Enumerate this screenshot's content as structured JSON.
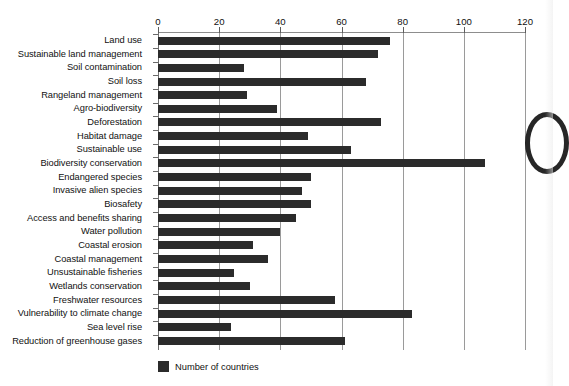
{
  "chart_data": {
    "type": "bar",
    "orientation": "horizontal",
    "title": "",
    "xlabel": "",
    "ylabel": "",
    "xlim": [
      0,
      120
    ],
    "xticks": [
      0,
      20,
      40,
      60,
      80,
      100,
      120
    ],
    "grid": true,
    "legend": {
      "position": "bottom-left",
      "entries": [
        {
          "label": "Number of countries",
          "color": "#2b2b2b"
        }
      ]
    },
    "series": [
      {
        "name": "Number of countries",
        "color": "#2b2b2b",
        "values": [
          76,
          72,
          28,
          68,
          29,
          39,
          73,
          49,
          63,
          107,
          50,
          47,
          50,
          45,
          40,
          31,
          36,
          25,
          30,
          58,
          83,
          24,
          61
        ]
      }
    ],
    "categories": [
      "Land use",
      "Sustainable land management",
      "Soil contamination",
      "Soil loss",
      "Rangeland management",
      "Agro-biodiversity",
      "Deforestation",
      "Habitat damage",
      "Sustainable use",
      "Biodiversity conservation",
      "Endangered species",
      "Invasive alien species",
      "Biosafety",
      "Access and benefits sharing",
      "Water pollution",
      "Coastal erosion",
      "Coastal management",
      "Unsustainable fisheries",
      "Wetlands conservation",
      "Freshwater resources",
      "Vulnerability to climate change",
      "Sea level rise",
      "Reduction of greenhouse gases"
    ]
  }
}
